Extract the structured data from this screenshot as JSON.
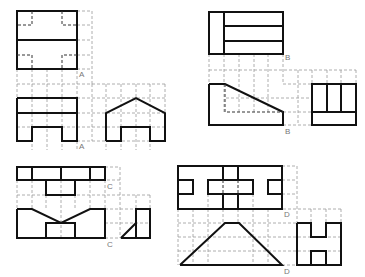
{
  "colors": {
    "outline": "#111111",
    "grid": "#9a9a9a",
    "label": "#777777",
    "background": "#ffffff"
  },
  "figures": [
    {
      "id": "A",
      "labels": [
        "A",
        "A"
      ],
      "views": [
        "top",
        "front",
        "side"
      ]
    },
    {
      "id": "B",
      "labels": [
        "B",
        "B"
      ],
      "views": [
        "top",
        "front",
        "side"
      ]
    },
    {
      "id": "C",
      "labels": [
        "C",
        "C"
      ],
      "views": [
        "top",
        "front",
        "side"
      ]
    },
    {
      "id": "D",
      "labels": [
        "D",
        "D"
      ],
      "views": [
        "top",
        "front",
        "side"
      ]
    }
  ]
}
